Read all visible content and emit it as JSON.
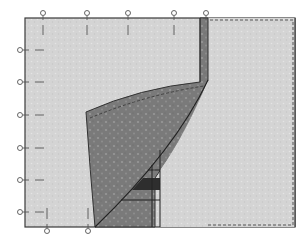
{
  "diagram": {
    "title": "Sewing diagram: pinned fabric pieces",
    "colors": {
      "background": "#ffffff",
      "light_fabric": "#d4d4d4",
      "light_fabric_speckle": "#e6e6e6",
      "dark_fabric": "#7a7a7a",
      "dark_fabric_speckle": "#9a9a9a",
      "band_dark": "#2e2e2e",
      "outline": "#3a3a3a",
      "stitch_line": "#555555"
    },
    "pins": {
      "top_x": [
        43,
        87,
        128,
        174,
        206
      ],
      "left_y": [
        50,
        82,
        115,
        148,
        180,
        212
      ],
      "bottom_x": [
        47,
        88
      ]
    },
    "annotations": {
      "light_piece": "light background fabric",
      "dark_piece": "dark patterned fabric",
      "right_piece": "light fabric with stitching line",
      "band": "dark contrast band"
    }
  }
}
